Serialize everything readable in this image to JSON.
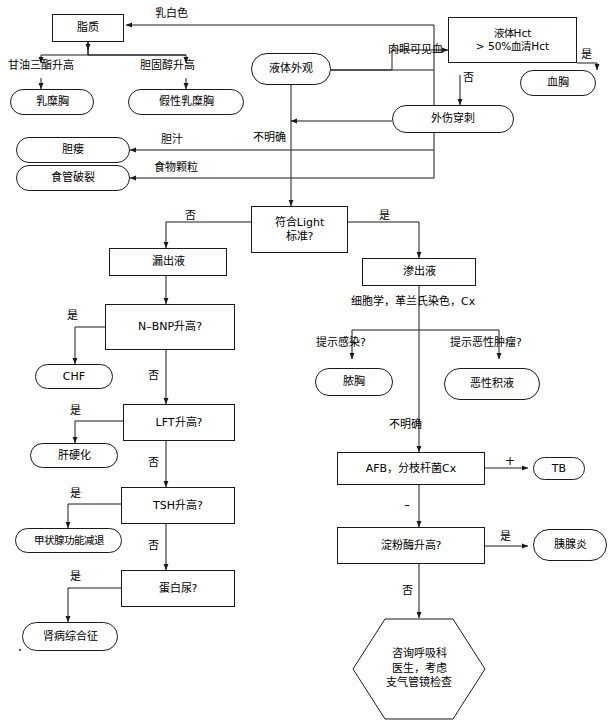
{
  "canvas": {
    "width": 615,
    "height": 724,
    "background": "#ffffff",
    "stroke": "#1a1a1a"
  },
  "nodes": {
    "lipid": "脂质",
    "chylothorax": "乳糜胸",
    "pseudochylothorax": "假性乳糜胸",
    "biliary_fistula": "胆瘘",
    "esophageal_rupture": "食管破裂",
    "fluid_appearance": "液体外观",
    "fluid_hct": "液体Hct\n> 50%血清Hct",
    "hemothorax": "血胸",
    "traumatic_tap": "外伤穿刺",
    "light_criteria": "符合Light\n标准?",
    "transudate": "漏出液",
    "exudate": "渗出液",
    "nbnp": "N–BNP升高?",
    "chf": "CHF",
    "lft": "LFT升高?",
    "cirrhosis": "肝硬化",
    "tsh": "TSH升高?",
    "hypothyroidism": "甲状腺功能减退",
    "proteinuria": "蛋白尿?",
    "nephrotic": "肾病综合征",
    "empyema": "脓胸",
    "malignant_effusion": "恶性积液",
    "afb": "AFB，分枝杆菌Cx",
    "tb": "TB",
    "amylase": "淀粉酶升高?",
    "pancreatitis": "胰腺炎",
    "consult": "咨询呼吸科\n医生，考虑\n支气管镜检查"
  },
  "edge_labels": {
    "milky_white": "乳白色",
    "triglyceride_high": "甘油三酯升高",
    "cholesterol_high": "胆固醇升高",
    "bile": "胆汁",
    "food_particles": "食物颗粒",
    "gross_blood": "肉眼可见血",
    "hct_yes": "是",
    "hct_no": "否",
    "indeterminate_appearance": "不明确",
    "light_no": "否",
    "light_yes": "是",
    "nbnp_yes": "是",
    "nbnp_no": "否",
    "lft_yes": "是",
    "lft_no": "否",
    "tsh_yes": "是",
    "tsh_no": "否",
    "proteinuria_yes": "是",
    "cytology_gram_cx": "细胞学，革兰氏染色，Cx",
    "suggests_infection": "提示感染?",
    "suggests_malignancy": "提示恶性肿瘤?",
    "indeterminate_exudate": "不明确",
    "afb_positive": "+",
    "afb_negative": "–",
    "amylase_yes": "是",
    "amylase_no": "否"
  }
}
